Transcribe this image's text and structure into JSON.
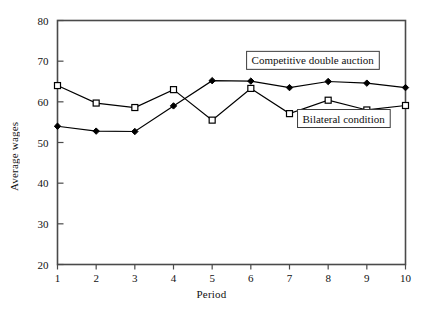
{
  "chart_data": {
    "type": "line",
    "title": "",
    "xlabel": "Period",
    "ylabel": "Average wages",
    "x": [
      1,
      2,
      3,
      4,
      5,
      6,
      7,
      8,
      9,
      10
    ],
    "xticklabels": [
      "1",
      "2",
      "3",
      "4",
      "5",
      "6",
      "7",
      "8",
      "9",
      "10"
    ],
    "yticklabels": [
      "20",
      "30",
      "40",
      "50",
      "60",
      "70",
      "80"
    ],
    "yticks": [
      20,
      30,
      40,
      50,
      60,
      70,
      80
    ],
    "xlim": [
      1,
      10
    ],
    "ylim": [
      20,
      80
    ],
    "grid": false,
    "legend_position": "inline-annotation-boxed",
    "series": [
      {
        "name": "Competitive double auction",
        "marker": "filled-diamond",
        "color": "#000000",
        "values": [
          54.0,
          52.8,
          52.7,
          59.0,
          65.2,
          65.1,
          63.5,
          65.0,
          64.6,
          63.5
        ]
      },
      {
        "name": "Bilateral condition",
        "marker": "open-square",
        "color": "#000000",
        "values": [
          64.0,
          59.7,
          58.6,
          63.0,
          55.5,
          63.3,
          57.1,
          60.4,
          58.0,
          59.1
        ]
      }
    ],
    "annotations": [
      {
        "text": "Competitive double auction",
        "x_value": 7.6,
        "y_value": 70.2,
        "boxed": true
      },
      {
        "text": "Bilateral condition",
        "x_value": 8.4,
        "y_value": 55.9,
        "boxed": true
      }
    ]
  },
  "figure": {
    "caption": ""
  }
}
